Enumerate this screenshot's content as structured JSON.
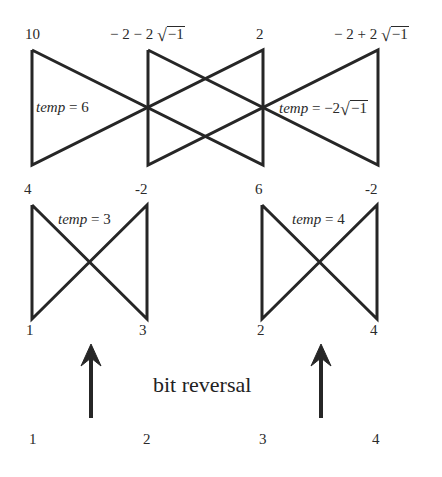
{
  "stage2": {
    "top_labels": [
      "10",
      "− 2 − 2",
      "2",
      "− 2 + 2"
    ],
    "sqrt_arg": "−1",
    "temp_left": {
      "name": "temp",
      "eq": " = 6"
    },
    "temp_right": {
      "name": "temp",
      "eq": " = −2",
      "sqrt_arg": "−1"
    }
  },
  "stage1": {
    "left": {
      "top": [
        "4",
        "-2"
      ],
      "bottom": [
        "1",
        "3"
      ],
      "temp": {
        "name": "temp",
        "eq": " = 3"
      }
    },
    "right": {
      "top": [
        "6",
        "-2"
      ],
      "bottom": [
        "2",
        "4"
      ],
      "temp": {
        "name": "temp",
        "eq": " = 4"
      }
    }
  },
  "caption": "bit reversal",
  "inputs": [
    "1",
    "2",
    "3",
    "4"
  ]
}
